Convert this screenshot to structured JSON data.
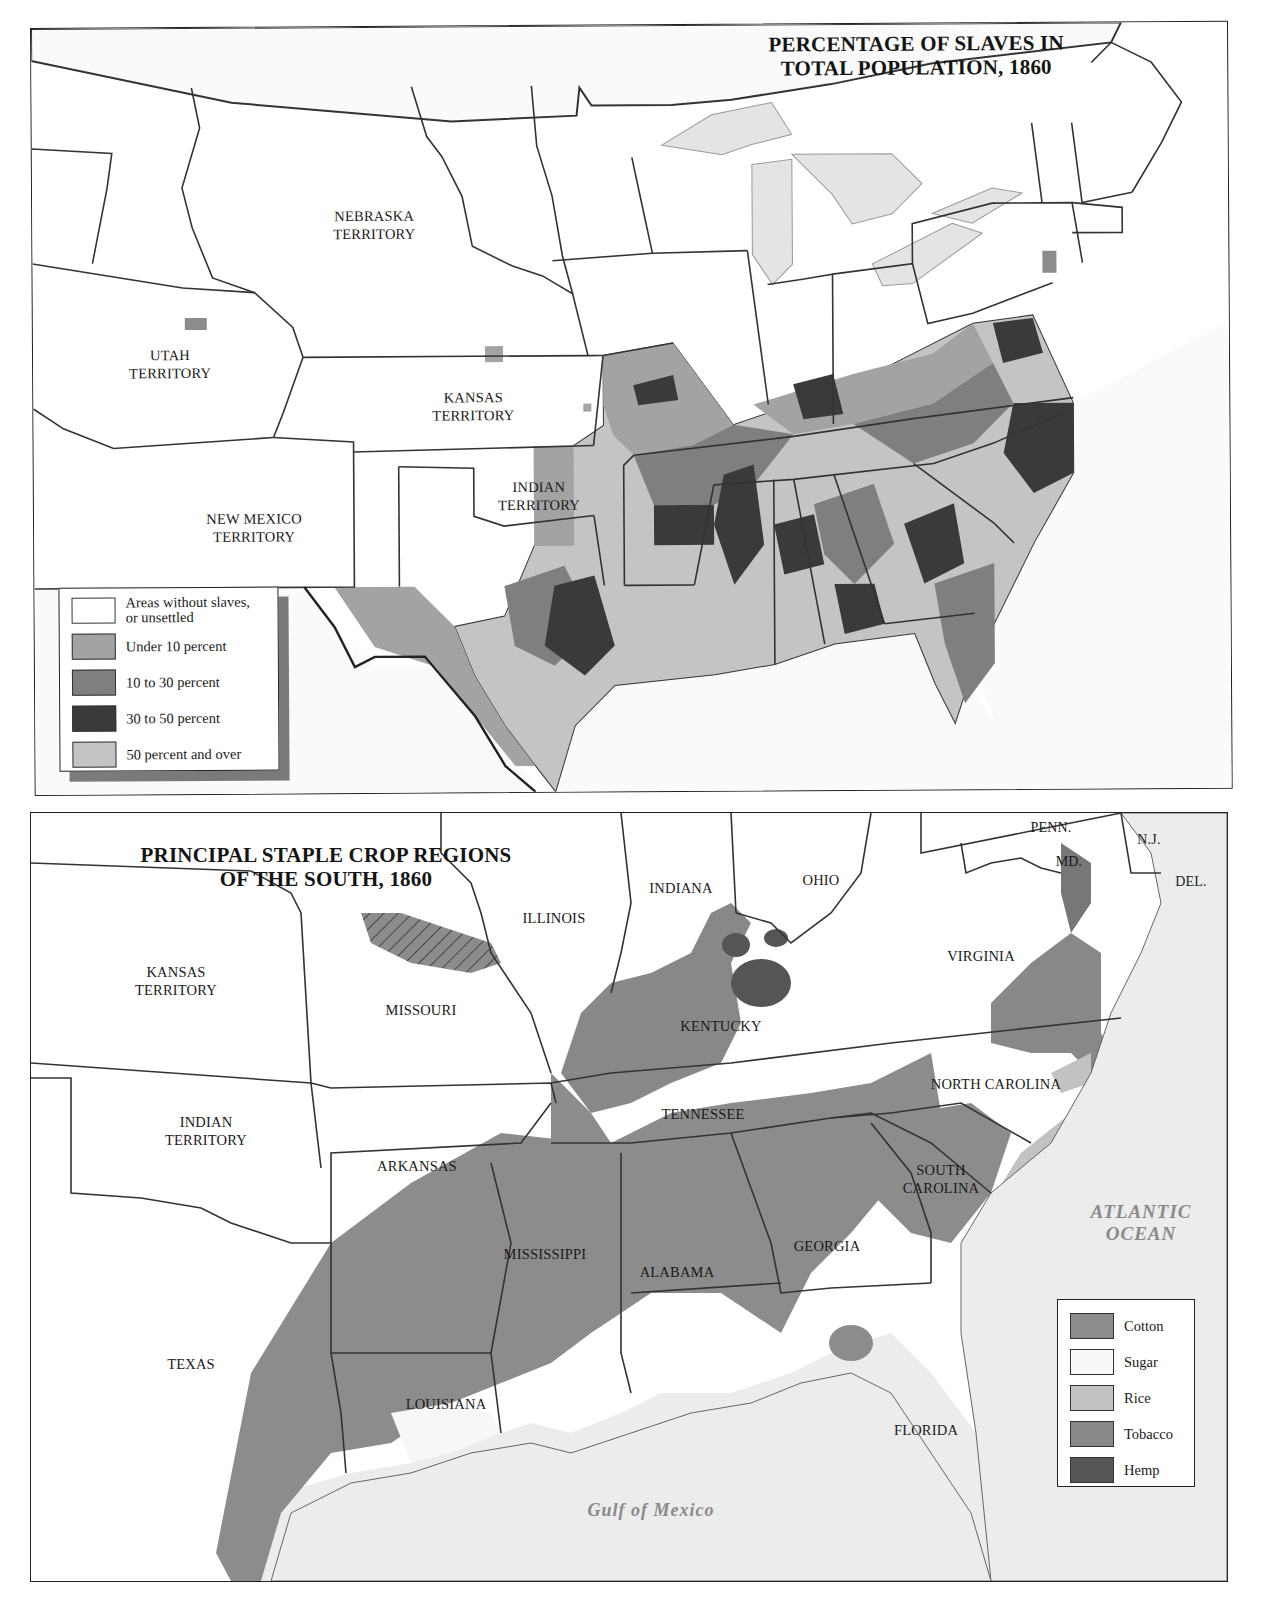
{
  "top_map": {
    "title_line1": "PERCENTAGE OF SLAVES IN",
    "title_line2": "TOTAL POPULATION, 1860",
    "labels": {
      "nebraska": [
        "NEBRASKA",
        "TERRITORY"
      ],
      "utah": [
        "UTAH",
        "TERRITORY"
      ],
      "kansas": [
        "KANSAS",
        "TERRITORY"
      ],
      "indian": [
        "INDIAN",
        "TERRITORY"
      ],
      "new_mexico": [
        "NEW MEXICO",
        "TERRITORY"
      ]
    },
    "legend": [
      {
        "label_line1": "Areas without slaves,",
        "label_line2": "or unsettled",
        "color": "#ffffff"
      },
      {
        "label_line1": "Under 10 percent",
        "label_line2": "",
        "color": "#a3a3a3"
      },
      {
        "label_line1": "10 to 30 percent",
        "label_line2": "",
        "color": "#7f7f7f"
      },
      {
        "label_line1": "30 to 50 percent",
        "label_line2": "",
        "color": "#3a3a3a"
      },
      {
        "label_line1": "50 percent and over",
        "label_line2": "",
        "color": "#c4c4c4"
      }
    ],
    "colors": {
      "water": "#e4e4e4",
      "border": "#333333"
    }
  },
  "bottom_map": {
    "title_line1": "PRINCIPAL STAPLE CROP REGIONS",
    "title_line2": "OF THE SOUTH, 1860",
    "labels": {
      "penn": "PENN.",
      "nj": "N.J.",
      "md": "MD.",
      "del": "DEL.",
      "indiana": "INDIANA",
      "ohio": "OHIO",
      "illinois": "ILLINOIS",
      "virginia": "VIRGINIA",
      "kansas": [
        "KANSAS",
        "TERRITORY"
      ],
      "missouri": "MISSOURI",
      "kentucky": "KENTUCKY",
      "north_carolina": "NORTH CAROLINA",
      "indian": [
        "INDIAN",
        "TERRITORY"
      ],
      "tennessee": "TENNESSEE",
      "arkansas": "ARKANSAS",
      "south_carolina": [
        "SOUTH",
        "CAROLINA"
      ],
      "mississippi": "MISSISSIPPI",
      "alabama": "ALABAMA",
      "georgia": "GEORGIA",
      "texas": "TEXAS",
      "louisiana": "LOUISIANA",
      "florida": "FLORIDA"
    },
    "water_labels": {
      "atlantic": [
        "ATLANTIC",
        "OCEAN"
      ],
      "gulf": "Gulf of Mexico"
    },
    "legend": [
      {
        "label": "Cotton",
        "color": "#8c8c8c"
      },
      {
        "label": "Sugar",
        "color": "#f7f7f7"
      },
      {
        "label": "Rice",
        "color": "#c2c2c2"
      },
      {
        "label": "Tobacco",
        "color": "#888888"
      },
      {
        "label": "Hemp",
        "color": "#555555"
      }
    ],
    "colors": {
      "water": "#ececec",
      "land": "#ffffff",
      "border": "#333333"
    }
  }
}
